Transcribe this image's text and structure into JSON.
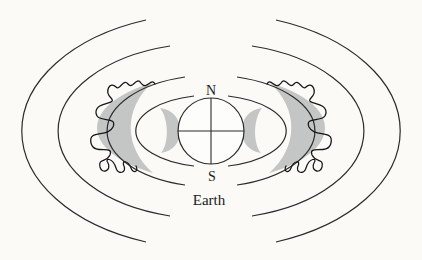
{
  "diagram": {
    "labels": {
      "north_pole": "N",
      "south_pole": "S",
      "earth": "Earth"
    },
    "colors": {
      "background": "#fbfaf7",
      "field_line": "#2b2b2b",
      "belt_fill": "#c3c6c5",
      "particle_path": "#161616",
      "earth_fill": "#fdfdfb",
      "text": "#1a1a1a"
    }
  }
}
